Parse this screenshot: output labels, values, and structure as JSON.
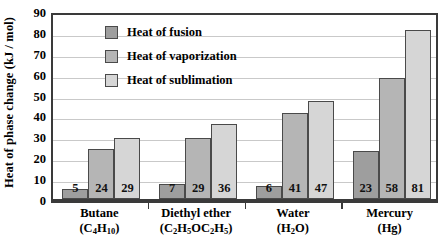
{
  "chart_data": {
    "type": "bar",
    "title": "",
    "xlabel": "",
    "ylabel": "Heat of phase change (kJ/mol)",
    "ylim": [
      0,
      90
    ],
    "ytick_step": 10,
    "yticks": [
      0,
      10,
      20,
      30,
      40,
      50,
      60,
      70,
      80,
      90
    ],
    "grid": true,
    "legend_position": "upper-left-inside",
    "categories": [
      "Butane",
      "Diethyl ether",
      "Water",
      "Mercury"
    ],
    "category_formulas": [
      "(C4H10)",
      "(C2H5OC2H5)",
      "(H2O)",
      "(Hg)"
    ],
    "series": [
      {
        "name": "Heat of fusion",
        "values": [
          5,
          7,
          6,
          23
        ],
        "color": "#9e9e9e"
      },
      {
        "name": "Heat of vaporization",
        "values": [
          24,
          29,
          41,
          58
        ],
        "color": "#b5b5b5"
      },
      {
        "name": "Heat of sublimation",
        "values": [
          29,
          36,
          47,
          81
        ],
        "color": "#d6d6d6"
      }
    ]
  },
  "axis": {
    "y_title": "Heat of phase change (kJ / mol)",
    "y_ticks": [
      "90",
      "80",
      "70",
      "60",
      "50",
      "40",
      "30",
      "20",
      "10",
      "0"
    ]
  },
  "legend": {
    "items": [
      {
        "label": "Heat of fusion"
      },
      {
        "label": "Heat of vaporization"
      },
      {
        "label": "Heat of sublimation"
      }
    ]
  },
  "groups": [
    {
      "name": "Butane",
      "formula_parts": [
        {
          "t": "(C"
        },
        {
          "sub": "4"
        },
        {
          "t": "H"
        },
        {
          "sub": "10"
        },
        {
          "t": ")"
        }
      ],
      "values": [
        5,
        24,
        29
      ]
    },
    {
      "name": "Diethyl ether",
      "formula_parts": [
        {
          "t": "(C"
        },
        {
          "sub": "2"
        },
        {
          "t": "H"
        },
        {
          "sub": "5"
        },
        {
          "t": "OC"
        },
        {
          "sub": "2"
        },
        {
          "t": "H"
        },
        {
          "sub": "5"
        },
        {
          "t": ")"
        }
      ],
      "values": [
        7,
        29,
        36
      ]
    },
    {
      "name": "Water",
      "formula_parts": [
        {
          "t": "(H"
        },
        {
          "sub": "2"
        },
        {
          "t": "O)"
        }
      ],
      "values": [
        6,
        41,
        47
      ]
    },
    {
      "name": "Mercury",
      "formula_parts": [
        {
          "t": "(Hg)"
        }
      ],
      "values": [
        23,
        58,
        81
      ]
    }
  ],
  "bar_labels": {
    "butane": [
      "5",
      "24",
      "29"
    ],
    "diethyl_ether": [
      "7",
      "29",
      "36"
    ],
    "water": [
      "6",
      "41",
      "47"
    ],
    "mercury": [
      "23",
      "58",
      "81"
    ]
  },
  "colors": {
    "fusion": "#9e9e9e",
    "vaporization": "#b5b5b5",
    "sublimation": "#d6d6d6",
    "axis": "#3a3a3a",
    "grid": "#c9c9c9",
    "background": "#ffffff"
  }
}
